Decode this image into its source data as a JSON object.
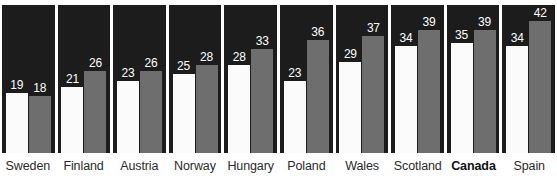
{
  "chart_data": {
    "type": "bar",
    "title": "",
    "subtitle": "",
    "xlabel": "",
    "ylabel": "",
    "ylim": [
      0,
      47
    ],
    "grid": false,
    "legend_position": "none",
    "categories": [
      "Sweden",
      "Finland",
      "Austria",
      "Norway",
      "Hungary",
      "Poland",
      "Wales",
      "Scotland",
      "Canada",
      "Spain"
    ],
    "highlighted_category": "Canada",
    "series": [
      {
        "name": "series-a",
        "color": "#fbfbfb",
        "values": [
          19,
          21,
          23,
          25,
          28,
          23,
          29,
          34,
          35,
          34
        ]
      },
      {
        "name": "series-b",
        "color": "#6e6e6e",
        "values": [
          18,
          26,
          26,
          28,
          33,
          36,
          37,
          39,
          39,
          42
        ]
      }
    ],
    "panel_background": "#1c1c1c",
    "value_label_color": "#ffffff",
    "category_label_color": "#2b2b2b"
  },
  "groups": [
    {
      "label": "Sweden",
      "bold": false,
      "a": 19,
      "b": 18
    },
    {
      "label": "Finland",
      "bold": false,
      "a": 21,
      "b": 26
    },
    {
      "label": "Austria",
      "bold": false,
      "a": 23,
      "b": 26
    },
    {
      "label": "Norway",
      "bold": false,
      "a": 25,
      "b": 28
    },
    {
      "label": "Hungary",
      "bold": false,
      "a": 28,
      "b": 33
    },
    {
      "label": "Poland",
      "bold": false,
      "a": 23,
      "b": 36
    },
    {
      "label": "Wales",
      "bold": false,
      "a": 29,
      "b": 37
    },
    {
      "label": "Scotland",
      "bold": false,
      "a": 34,
      "b": 39
    },
    {
      "label": "Canada",
      "bold": true,
      "a": 35,
      "b": 39
    },
    {
      "label": "Spain",
      "bold": false,
      "a": 34,
      "b": 42
    }
  ]
}
